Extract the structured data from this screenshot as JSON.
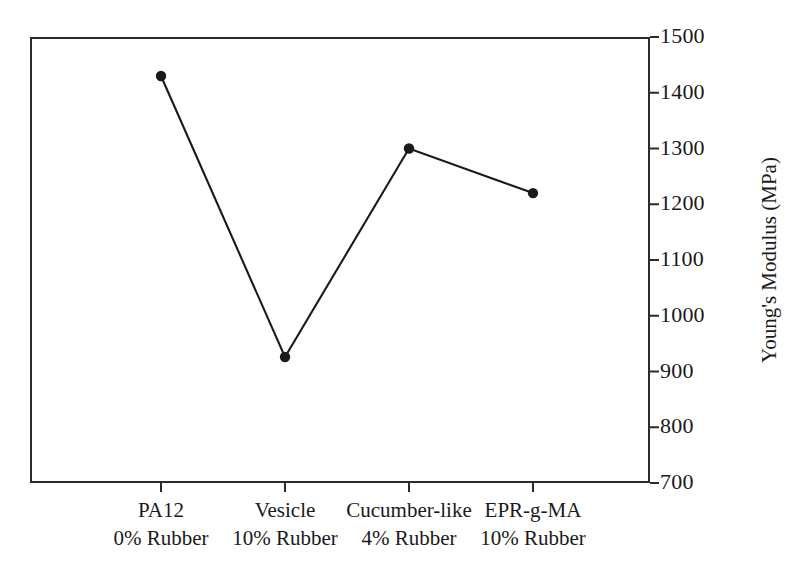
{
  "chart_data": {
    "type": "line",
    "title": "",
    "subtitle": "",
    "xlabel": "",
    "ylabel": "Young's Modulus (MPa)",
    "categories": [
      "PA12\n0% Rubber",
      "Vesicle\n10% Rubber",
      "Cucumber-like\n4% Rubber",
      "EPR-g-MA\n10% Rubber"
    ],
    "category_lines": [
      {
        "line1": "PA12",
        "line2": "0% Rubber"
      },
      {
        "line1": "Vesicle",
        "line2": "10% Rubber"
      },
      {
        "line1": "Cucumber-like",
        "line2": "4% Rubber"
      },
      {
        "line1": "EPR-g-MA",
        "line2": "10% Rubber"
      }
    ],
    "values": [
      1430,
      926,
      1300,
      1220
    ],
    "ylim": [
      700,
      1500
    ],
    "ytick_values": [
      700,
      800,
      900,
      1000,
      1100,
      1200,
      1300,
      1400,
      1500
    ],
    "ytick_labels": [
      "700",
      "800",
      "900",
      "1000",
      "1100",
      "1200",
      "1300",
      "1400",
      "1500"
    ],
    "y_axis_position": "right",
    "grid": false,
    "legend": "none",
    "marker": "filled-circle",
    "line_color": "#1a1a1a",
    "marker_color": "#1a1a1a",
    "frame_color": "#2b2b2b",
    "background_color": "#ffffff"
  },
  "axes": {
    "y": {
      "title": "Young's Modulus (MPa)",
      "ticks": [
        {
          "label": "1500",
          "value": 1500
        },
        {
          "label": "1400",
          "value": 1400
        },
        {
          "label": "1300",
          "value": 1300
        },
        {
          "label": "1200",
          "value": 1200
        },
        {
          "label": "1100",
          "value": 1100
        },
        {
          "label": "1000",
          "value": 1000
        },
        {
          "label": "900",
          "value": 900
        },
        {
          "label": "800",
          "value": 800
        },
        {
          "label": "700",
          "value": 700
        }
      ]
    },
    "x": {
      "ticks": [
        {
          "line1": "PA12",
          "line2": "0% Rubber"
        },
        {
          "line1": "Vesicle",
          "line2": "10% Rubber"
        },
        {
          "line1": "Cucumber-like",
          "line2": "4% Rubber"
        },
        {
          "line1": "EPR-g-MA",
          "line2": "10% Rubber"
        }
      ]
    }
  }
}
